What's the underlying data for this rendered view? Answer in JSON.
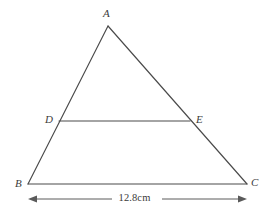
{
  "figure": {
    "kind": "geometry-diagram",
    "stroke_color": "#4a4a4a",
    "text_color": "#3c3c3c",
    "background_color": "#ffffff",
    "vertices": [
      {
        "name": "A",
        "label": "A",
        "x": 108,
        "y": 26
      },
      {
        "name": "B",
        "label": "B",
        "x": 28,
        "y": 184
      },
      {
        "name": "C",
        "label": "C",
        "x": 247,
        "y": 184
      },
      {
        "name": "D",
        "label": "D",
        "x": 59,
        "y": 121
      },
      {
        "name": "E",
        "label": "E",
        "x": 190,
        "y": 121
      }
    ],
    "segments": [
      {
        "name": "side-AB",
        "from": "A",
        "to": "B"
      },
      {
        "name": "side-AC",
        "from": "A",
        "to": "C"
      },
      {
        "name": "base-BC",
        "from": "B",
        "to": "C"
      },
      {
        "name": "segment-DE",
        "from": "D",
        "to": "E"
      }
    ],
    "dimension": {
      "name": "base-length",
      "measures": "BC",
      "value": "12.8",
      "unit": "cm",
      "text": "12.8cm",
      "y": 199,
      "x_start": 28,
      "x_end": 247,
      "arrow_both_ends": true
    }
  }
}
